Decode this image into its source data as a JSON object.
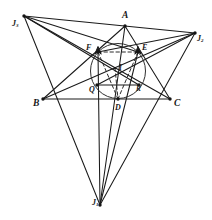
{
  "figure": {
    "type": "euclidean-geometry-diagram",
    "width": 212,
    "height": 220,
    "background_color": "#ffffff",
    "stroke_color": "#1a1a1a",
    "dashed_color": "#2b2b2b"
  },
  "labels": {
    "A": "A",
    "B": "B",
    "C": "C",
    "D": "D",
    "E": "E",
    "F": "F",
    "I": "I",
    "Q": "Q",
    "R": "R",
    "J1_main": "J",
    "J1_sub": "1",
    "J2_main": "J",
    "J2_sub": "2",
    "J3_main": "J",
    "J3_sub": "3"
  },
  "points": {
    "A": {
      "x": 125,
      "y": 26,
      "label_x": 122,
      "label_y": 11,
      "marker": true
    },
    "B": {
      "x": 43,
      "y": 99,
      "label_x": 33,
      "label_y": 99,
      "marker": true
    },
    "C": {
      "x": 170,
      "y": 99,
      "label_x": 174,
      "label_y": 99,
      "marker": true
    },
    "D": {
      "x": 118,
      "y": 99,
      "label_x": 115,
      "label_y": 104,
      "marker": true
    },
    "E": {
      "x": 138,
      "y": 52,
      "label_x": 142,
      "label_y": 44,
      "marker": true
    },
    "F": {
      "x": 98,
      "y": 52,
      "label_x": 86,
      "label_y": 44,
      "marker": true
    },
    "I": {
      "x": 115,
      "y": 68,
      "label_x": 119,
      "label_y": 64,
      "marker": true
    },
    "Q": {
      "x": 97,
      "y": 85,
      "label_x": 89,
      "label_y": 86,
      "marker": true
    },
    "R": {
      "x": 139,
      "y": 85,
      "label_x": 136,
      "label_y": 85,
      "marker": true
    },
    "J1": {
      "x": 100,
      "y": 205,
      "label_x": 92,
      "label_y": 199,
      "marker": true
    },
    "J2": {
      "x": 195,
      "y": 33,
      "label_x": 197,
      "label_y": 35,
      "marker": true
    },
    "J3": {
      "x": 24,
      "y": 16,
      "label_x": 12,
      "label_y": 20,
      "marker": true
    }
  },
  "incircle": {
    "center_x": 118,
    "center_y": 71,
    "radius": 27.5,
    "stroke_color": "#2f2f2f",
    "stroke_width": 1.0
  },
  "solid_segments": [
    {
      "name": "side-AB",
      "from": "A",
      "to": "B"
    },
    {
      "name": "side-AC",
      "from": "A",
      "to": "C"
    },
    {
      "name": "side-BC",
      "from": "B",
      "to": "C"
    },
    {
      "name": "excentral-J2-J3",
      "from": "J3",
      "to": "J2"
    },
    {
      "name": "excentral-J1-J2",
      "from": "J1",
      "to": "J2"
    },
    {
      "name": "excentral-J1-J3",
      "from": "J1",
      "to": "J3"
    },
    {
      "name": "line-J3-to-C",
      "from": "J3",
      "to": "C"
    },
    {
      "name": "line-J2-to-B",
      "from": "J2",
      "to": "B"
    },
    {
      "name": "line-J3-to-R",
      "from": "J3",
      "to": "R"
    },
    {
      "name": "line-J2-to-Q",
      "from": "J2",
      "to": "Q"
    },
    {
      "name": "line-A-to-J1",
      "from": "A",
      "to": "J1"
    },
    {
      "name": "line-F-to-J1",
      "from": "F",
      "to": "J1"
    },
    {
      "name": "line-E-to-J1",
      "from": "E",
      "to": "J1"
    },
    {
      "name": "line-J3-to-E",
      "from": "J3",
      "to": "E"
    },
    {
      "name": "line-J2-to-F",
      "from": "J2",
      "to": "F"
    },
    {
      "name": "segment-Q-R",
      "from": "Q",
      "to": "R"
    }
  ],
  "dashed_segments": [
    {
      "name": "chord-F-to-E",
      "from": "F",
      "to": "E",
      "arrow_start": true,
      "arrow_end": true
    },
    {
      "name": "cevian-F-to-D",
      "from": "F",
      "to": "D",
      "arrow_start": false,
      "arrow_end": false
    },
    {
      "name": "cevian-E-to-D",
      "from": "E",
      "to": "D",
      "arrow_start": false,
      "arrow_end": false
    },
    {
      "name": "radius-I-to-D",
      "from": "I",
      "to": "D",
      "arrow_start": false,
      "arrow_end": false
    }
  ],
  "arrow_marks": [
    {
      "name": "arrow-at-F",
      "x": 98,
      "y": 52
    },
    {
      "name": "arrow-at-E",
      "x": 138,
      "y": 52
    }
  ]
}
